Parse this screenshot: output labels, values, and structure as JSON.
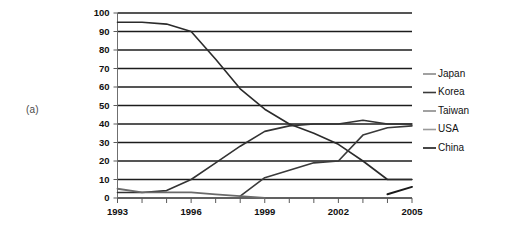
{
  "figure": {
    "panel_label": "(a)"
  },
  "chart_data": {
    "type": "line",
    "title": "",
    "subtitle": "",
    "xlabel": "",
    "ylabel": "",
    "xlim": [
      1993,
      2005
    ],
    "ylim": [
      0,
      100
    ],
    "grid": "horizontal",
    "legend_position": "right",
    "y_ticks": [
      0,
      10,
      20,
      30,
      40,
      50,
      60,
      70,
      80,
      90,
      100
    ],
    "y_tick_labels": [
      "0",
      "10",
      "20",
      "30",
      "40",
      "50",
      "60",
      "70",
      "80",
      "90",
      "100"
    ],
    "x_ticks": [
      1993,
      1994,
      1995,
      1996,
      1997,
      1998,
      1999,
      2000,
      2001,
      2002,
      2003,
      2004,
      2005
    ],
    "x_tick_labels": [
      "1993",
      "",
      "",
      "1996",
      "",
      "",
      "1999",
      "",
      "",
      "2002",
      "",
      "",
      "2005"
    ],
    "x_labeled_ticks": [
      "1993",
      "1996",
      "1999",
      "2002",
      "2005"
    ],
    "x": [
      1993,
      1994,
      1995,
      1996,
      1997,
      1998,
      1999,
      2000,
      2001,
      2002,
      2003,
      2004,
      2005
    ],
    "series": [
      {
        "name": "Japan",
        "color": "#2b2b2b",
        "width": 1.6,
        "x": [
          1993,
          1994,
          1995,
          1996,
          1997,
          1998,
          1999,
          2000,
          2001,
          2002,
          2003,
          2004,
          2005
        ],
        "values": [
          95,
          95,
          94,
          90,
          75,
          59,
          48,
          40,
          35,
          29,
          20,
          10,
          10
        ]
      },
      {
        "name": "Korea",
        "color": "#333333",
        "width": 1.6,
        "x": [
          1993,
          1994,
          1995,
          1996,
          1997,
          1998,
          1999,
          2000,
          2001,
          2002,
          2003,
          2004,
          2005
        ],
        "values": [
          3,
          3,
          4,
          10,
          19,
          28,
          36,
          39,
          40,
          40,
          42,
          40,
          40
        ]
      },
      {
        "name": "Taiwan",
        "color": "#3a3a3a",
        "width": 1.6,
        "x": [
          1998,
          1999,
          2000,
          2001,
          2002,
          2003,
          2004,
          2005
        ],
        "values": [
          1,
          11,
          15,
          19,
          20,
          34,
          38,
          39
        ]
      },
      {
        "name": "USA",
        "color": "#6a6a6a",
        "width": 1.8,
        "x": [
          1993,
          1994,
          1995,
          1996,
          1997,
          1998,
          1999
        ],
        "values": [
          5,
          3,
          3,
          3,
          2,
          1,
          0
        ]
      },
      {
        "name": "China",
        "color": "#1a1a1a",
        "width": 2.0,
        "x": [
          2004,
          2005
        ],
        "values": [
          2,
          6
        ]
      }
    ],
    "legend_entries": [
      {
        "label": "Japan",
        "color": "#8a8a8a"
      },
      {
        "label": "Korea",
        "color": "#3a3a3a"
      },
      {
        "label": "Taiwan",
        "color": "#8a8a8a"
      },
      {
        "label": "USA",
        "color": "#9a9a9a"
      },
      {
        "label": "China",
        "color": "#1a1a1a"
      }
    ]
  }
}
